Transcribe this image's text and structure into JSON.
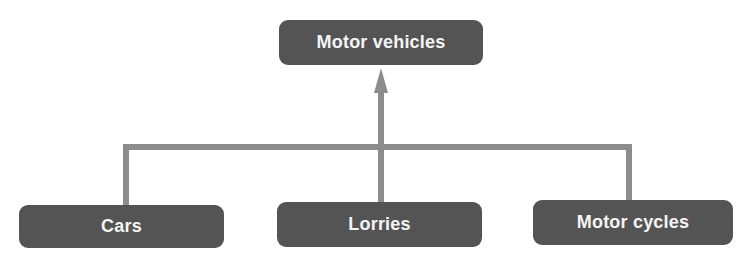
{
  "diagram": {
    "type": "hierarchy",
    "root": {
      "label": "Motor vehicles"
    },
    "children": [
      {
        "label": "Cars"
      },
      {
        "label": "Lorries"
      },
      {
        "label": "Motor cycles"
      }
    ],
    "relation": "children point up to parent (arrow into root)",
    "colors": {
      "node_fill": "#545454",
      "node_text": "#f4f4f4",
      "connector": "#8c8c8c",
      "background": "#ffffff"
    }
  }
}
